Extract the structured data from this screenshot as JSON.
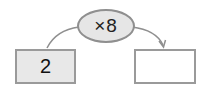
{
  "diagram": {
    "operation": {
      "label": "×8",
      "fill_color": "#e6e6e6",
      "border_color": "#8f8f8f"
    },
    "input_box": {
      "value": "2",
      "fill_color": "#e8e8e8"
    },
    "output_box": {
      "value": "",
      "fill_color": "#ffffff"
    },
    "connector_color": "#8f8f8f"
  }
}
